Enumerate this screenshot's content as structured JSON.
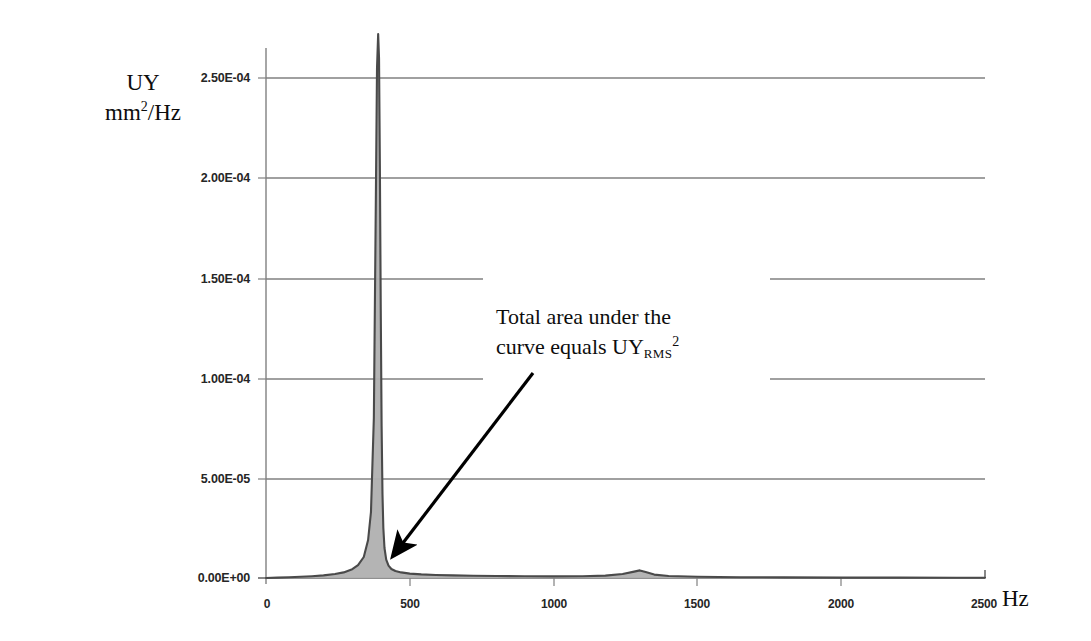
{
  "chart_data": {
    "type": "line",
    "title": "",
    "xlabel": "Hz",
    "ylabel_line1": "UY",
    "ylabel_line2_prefix": "mm",
    "ylabel_line2_sup": "2",
    "ylabel_line2_suffix": "/Hz",
    "xlim": [
      0,
      2500
    ],
    "ylim": [
      0.0,
      0.000275
    ],
    "grid": true,
    "legend": "none",
    "x_ticks": [
      "0",
      "500",
      "1000",
      "1500",
      "2000",
      "2500"
    ],
    "x_tick_values": [
      0,
      500,
      1000,
      1500,
      2000,
      2500
    ],
    "y_ticks": [
      "0.00E+00",
      "5.00E-05",
      "1.00E-04",
      "1.50E-04",
      "2.00E-04",
      "2.50E-04"
    ],
    "y_tick_values": [
      0.0,
      5e-05,
      0.0001,
      0.00015,
      0.0002,
      0.00025
    ],
    "series": [
      {
        "name": "UY PSD",
        "x": [
          0,
          40,
          80,
          120,
          160,
          200,
          240,
          270,
          300,
          320,
          340,
          355,
          365,
          375,
          382,
          386,
          390,
          393,
          396,
          399,
          402,
          405,
          408,
          412,
          418,
          426,
          436,
          450,
          470,
          500,
          540,
          590,
          650,
          720,
          800,
          900,
          1000,
          1100,
          1180,
          1240,
          1280,
          1300,
          1320,
          1350,
          1400,
          1500,
          1650,
          1800,
          2000,
          2200,
          2400,
          2500
        ],
        "y": [
          0.0,
          2e-07,
          4e-07,
          6e-07,
          9e-07,
          1.3e-06,
          2e-06,
          2.8e-06,
          4.4e-06,
          6.4e-06,
          1.05e-05,
          1.9e-05,
          3.3e-05,
          8e-05,
          0.00019,
          0.000255,
          0.000272,
          0.00026,
          0.000205,
          0.000135,
          7.6e-05,
          4.2e-05,
          2.5e-05,
          1.5e-05,
          9.2e-06,
          6.2e-06,
          4.5e-06,
          3.5e-06,
          2.8e-06,
          2.2e-06,
          1.8e-06,
          1.5e-06,
          1.3e-06,
          1.1e-06,
          1e-06,
          9e-07,
          8e-07,
          9e-07,
          1.2e-06,
          2e-06,
          3.2e-06,
          3.8e-06,
          3e-06,
          1.7e-06,
          1e-06,
          6e-07,
          4e-07,
          3e-07,
          2e-07,
          2e-07,
          1e-07,
          1e-07
        ]
      }
    ],
    "fill_under_curve": true,
    "annotations": [
      {
        "text_line1": "Total area under the",
        "text_line2_prefix": "curve equals UY",
        "text_line2_sub": "RMS",
        "text_line2_sup": "2",
        "arrow_from": [
          533,
          373
        ],
        "arrow_to": [
          393,
          556
        ]
      }
    ],
    "peak": {
      "frequency_hz": 390,
      "value": 0.000272
    },
    "secondary_peak": {
      "frequency_hz": 1300,
      "value": 3.8e-06
    },
    "colors": {
      "curve": "#4d4d4d",
      "fill": "#b3b3b3",
      "grid": "#808080",
      "axis": "#737373",
      "text": "#0d0d0d",
      "arrow": "#000000"
    }
  }
}
